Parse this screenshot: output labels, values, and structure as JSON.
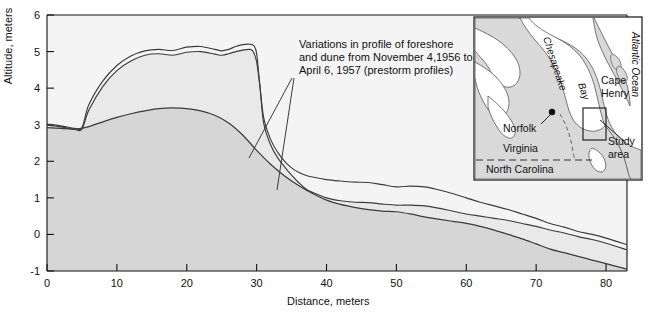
{
  "chart_data": {
    "type": "line",
    "title": "",
    "xlabel": "Distance, meters",
    "ylabel": "Altitude, meters",
    "xlim": [
      0,
      83
    ],
    "ylim": [
      -1,
      6
    ],
    "xticks": [
      0,
      10,
      20,
      30,
      40,
      50,
      60,
      70,
      80
    ],
    "yticks": [
      -1,
      0,
      1,
      2,
      3,
      4,
      5,
      6
    ],
    "grid": false,
    "legend": "none",
    "annotation": {
      "line1": "Variations in profile of foreshore",
      "line2": "and dune from November 4,1956 to",
      "line3": "April 6, 1957 (prestorm profiles)",
      "leader_targets": [
        "upper-profile",
        "lower-profile"
      ]
    },
    "series": [
      {
        "name": "November 4, 1956 profile (upper dune crest)",
        "x": [
          0,
          2,
          4,
          5,
          6,
          8,
          10,
          12,
          14,
          16,
          18,
          20,
          22,
          24,
          25,
          26,
          27,
          28,
          29,
          29.6,
          30,
          30.4,
          31,
          32,
          33,
          34,
          35,
          36,
          37,
          38,
          40,
          42,
          44,
          46,
          48,
          50,
          52,
          54,
          56,
          58,
          60,
          62,
          64,
          66,
          68,
          70,
          72,
          74,
          76,
          78,
          80,
          83
        ],
        "y": [
          3.02,
          2.97,
          2.9,
          2.92,
          3.55,
          4.2,
          4.62,
          4.88,
          5.02,
          5.06,
          5.03,
          5.12,
          5.14,
          5.06,
          5.02,
          5.06,
          5.14,
          5.19,
          5.2,
          5.16,
          4.95,
          4.2,
          3.2,
          2.6,
          2.25,
          2.0,
          1.82,
          1.7,
          1.62,
          1.57,
          1.5,
          1.46,
          1.43,
          1.42,
          1.36,
          1.3,
          1.32,
          1.3,
          1.22,
          1.12,
          1.0,
          0.88,
          0.78,
          0.68,
          0.56,
          0.44,
          0.3,
          0.2,
          0.08,
          0.0,
          -0.1,
          -0.28
        ]
      },
      {
        "name": "April 6, 1957 profile (lower dune crest)",
        "x": [
          0,
          2,
          4,
          5,
          6,
          8,
          10,
          12,
          14,
          16,
          18,
          20,
          22,
          24,
          25,
          26,
          27,
          28,
          29,
          29.5,
          30,
          30.5,
          31,
          32,
          33,
          34,
          35,
          36,
          37,
          38,
          40,
          42,
          44,
          46,
          48,
          50,
          52,
          54,
          56,
          58,
          60,
          62,
          64,
          66,
          68,
          70,
          72,
          74,
          76,
          78,
          80,
          83
        ],
        "y": [
          2.99,
          2.94,
          2.87,
          2.88,
          3.4,
          4.05,
          4.48,
          4.74,
          4.9,
          4.94,
          4.9,
          4.98,
          5.0,
          4.93,
          4.9,
          4.94,
          5.0,
          5.04,
          5.06,
          5.0,
          4.72,
          4.0,
          3.05,
          2.45,
          2.1,
          1.85,
          1.62,
          1.42,
          1.25,
          1.15,
          1.0,
          0.92,
          0.88,
          0.87,
          0.83,
          0.8,
          0.8,
          0.78,
          0.72,
          0.64,
          0.56,
          0.5,
          0.44,
          0.38,
          0.3,
          0.22,
          0.12,
          0.04,
          -0.06,
          -0.14,
          -0.24,
          -0.42
        ]
      },
      {
        "name": "Beach surface / berm profile (lower envelope)",
        "x": [
          0,
          2,
          4,
          6,
          8,
          10,
          12,
          14,
          16,
          18,
          20,
          22,
          24,
          26,
          28,
          30,
          32,
          34,
          36,
          38,
          40,
          42,
          44,
          46,
          48,
          50,
          52,
          54,
          56,
          58,
          60,
          62,
          64,
          66,
          68,
          70,
          72,
          74,
          76,
          78,
          80,
          83
        ],
        "y": [
          2.92,
          2.9,
          2.88,
          2.95,
          3.08,
          3.2,
          3.3,
          3.38,
          3.44,
          3.46,
          3.44,
          3.38,
          3.26,
          3.05,
          2.72,
          2.3,
          1.92,
          1.6,
          1.34,
          1.12,
          0.94,
          0.82,
          0.74,
          0.68,
          0.64,
          0.62,
          0.56,
          0.48,
          0.42,
          0.36,
          0.3,
          0.22,
          0.12,
          0.0,
          -0.12,
          -0.26,
          -0.4,
          -0.5,
          -0.6,
          -0.7,
          -0.8,
          -0.95
        ]
      }
    ]
  },
  "inset_map": {
    "name": "locator-map",
    "labels": {
      "chesapeake": "Chesapeake",
      "bay": "Bay",
      "cape": "Cape",
      "henry": "Henry",
      "atlantic": "Atlantic Ocean",
      "norfolk": "Norfolk",
      "virginia": "Virginia",
      "north_carolina": "North Carolina",
      "study_area_1": "Study",
      "study_area_2": "area"
    }
  },
  "colors": {
    "line": "#3c3c3c",
    "fill_upper": "#efefef",
    "fill_lower": "#d6d6d6",
    "map_land": "#d9d9d9",
    "map_water": "#ffffff",
    "axis": "#111111",
    "text": "#111111"
  }
}
